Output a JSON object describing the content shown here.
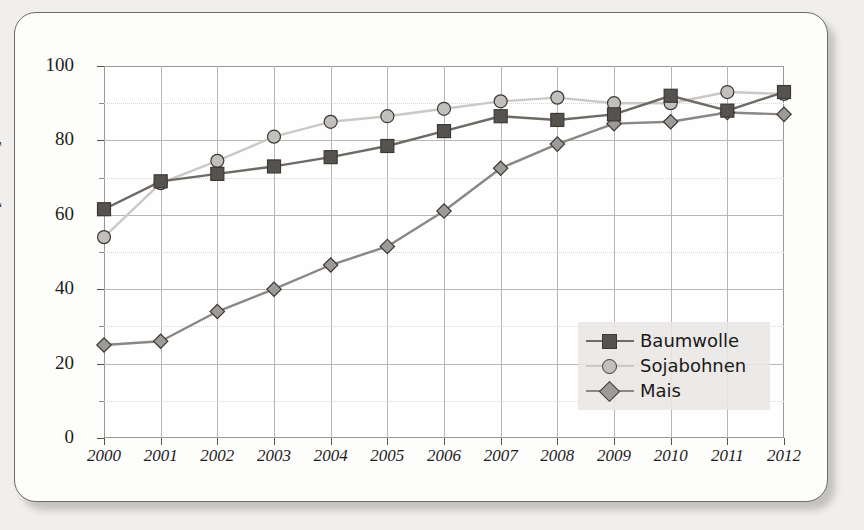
{
  "chart_data": {
    "type": "line",
    "title": "",
    "xlabel": "",
    "ylabel": "[Prozent]",
    "categories": [
      "2000",
      "2001",
      "2002",
      "2003",
      "2004",
      "2005",
      "2006",
      "2007",
      "2008",
      "2009",
      "2010",
      "2011",
      "2012"
    ],
    "ylim": [
      0,
      100
    ],
    "xlim_labels": [
      "2000",
      "2012"
    ],
    "ytick_labels": [
      "0",
      "20",
      "40",
      "60",
      "80",
      "100"
    ],
    "ytick_values": [
      0,
      20,
      40,
      60,
      80,
      100
    ],
    "yminor_values": [
      10,
      30,
      50,
      70,
      90
    ],
    "grid": true,
    "legend_position": "bottom-right",
    "series": [
      {
        "name": "Baumwolle",
        "marker": "square",
        "color": "#56534f",
        "line_color": "#6d6a66",
        "values": [
          61.5,
          69.0,
          71.0,
          73.0,
          75.5,
          78.5,
          82.5,
          86.5,
          85.5,
          87.0,
          92.0,
          88.0,
          93.0
        ]
      },
      {
        "name": "Sojabohnen",
        "marker": "circle",
        "color": "#c2c0bd",
        "line_color": "#cbc9c6",
        "values": [
          54.0,
          68.5,
          74.5,
          81.0,
          85.0,
          86.5,
          88.5,
          90.5,
          91.5,
          90.0,
          90.0,
          93.0,
          92.5
        ]
      },
      {
        "name": "Mais",
        "marker": "diamond",
        "color": "#9d9a97",
        "line_color": "#8a8784",
        "values": [
          25.0,
          26.0,
          34.0,
          40.0,
          46.5,
          51.5,
          61.0,
          72.5,
          79.0,
          84.5,
          85.0,
          87.5,
          87.0
        ]
      }
    ]
  },
  "legend": {
    "items": [
      {
        "label": "Baumwolle"
      },
      {
        "label": "Sojabohnen"
      },
      {
        "label": "Mais"
      }
    ]
  },
  "colors": {
    "background": "#f1efed",
    "card": "#fdfdfc",
    "axis": "#55524f",
    "grid_major": "#b9b6b3",
    "grid_minor": "#d8d5d2",
    "text": "#1d1c1b",
    "baumwolle": "#56534f",
    "sojabohnen": "#c2c0bd",
    "mais": "#9d9a97"
  }
}
